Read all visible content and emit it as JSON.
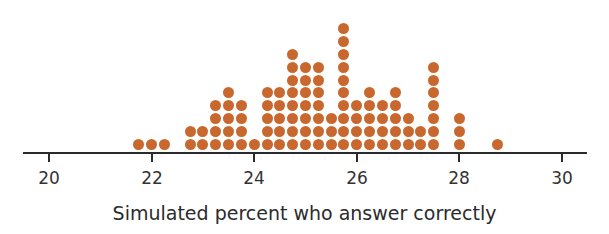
{
  "chart_data": {
    "type": "scatter",
    "subtype": "dot plot",
    "title": "",
    "xlabel": "Simulated percent who answer correctly",
    "ylabel": "",
    "xlim": [
      20,
      30
    ],
    "xticks": [
      20,
      22,
      24,
      26,
      28,
      30
    ],
    "grid": false,
    "legend": null,
    "dot_color": "#c8682e",
    "columns": [
      {
        "x": 21.75,
        "count": 1
      },
      {
        "x": 22.0,
        "count": 1
      },
      {
        "x": 22.25,
        "count": 1
      },
      {
        "x": 22.75,
        "count": 2
      },
      {
        "x": 23.0,
        "count": 2
      },
      {
        "x": 23.25,
        "count": 4
      },
      {
        "x": 23.5,
        "count": 5
      },
      {
        "x": 23.75,
        "count": 4
      },
      {
        "x": 24.0,
        "count": 1
      },
      {
        "x": 24.25,
        "count": 5
      },
      {
        "x": 24.5,
        "count": 5
      },
      {
        "x": 24.75,
        "count": 8
      },
      {
        "x": 25.0,
        "count": 7
      },
      {
        "x": 25.25,
        "count": 7
      },
      {
        "x": 25.5,
        "count": 3
      },
      {
        "x": 25.75,
        "count": 10
      },
      {
        "x": 26.0,
        "count": 4
      },
      {
        "x": 26.25,
        "count": 5
      },
      {
        "x": 26.5,
        "count": 4
      },
      {
        "x": 26.75,
        "count": 5
      },
      {
        "x": 27.0,
        "count": 3
      },
      {
        "x": 27.25,
        "count": 2
      },
      {
        "x": 27.5,
        "count": 7
      },
      {
        "x": 28.0,
        "count": 3
      },
      {
        "x": 28.75,
        "count": 1
      }
    ]
  },
  "axis": {
    "tick_labels": [
      "20",
      "22",
      "24",
      "26",
      "28",
      "30"
    ]
  },
  "labels": {
    "xlabel": "Simulated percent who answer correctly"
  }
}
